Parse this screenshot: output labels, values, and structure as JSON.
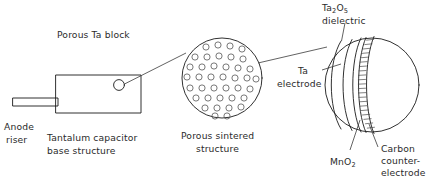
{
  "figure": {
    "title_visible": false,
    "background_color": "#ffffff",
    "line_color": "#1a1a1a",
    "text_color": "#2b2b2b"
  },
  "labels": {
    "porous_ta_block": "Porous Ta block",
    "anode_riser_line1": "Anode",
    "anode_riser_line2": "riser",
    "base_structure_line1": "Tantalum capacitor",
    "base_structure_line2": "base structure",
    "porous_sintered_line1": "Porous sintered",
    "porous_sintered_line2": "structure",
    "ta_electrode_line1": "Ta",
    "ta_electrode_line2": "electrode",
    "dielectric_formula_main1": "Ta",
    "dielectric_formula_sub1": "2",
    "dielectric_formula_main2": "O",
    "dielectric_formula_sub2": "5",
    "dielectric_word": "dielectric",
    "mno2_main1": "MnO",
    "mno2_sub": "2",
    "carbon_line1": "Carbon",
    "carbon_line2": "counter-",
    "carbon_line3": "electrode"
  },
  "views": {
    "base_block": {
      "name": "Tantalum capacitor base structure",
      "shape": "rectangle",
      "callout_circle": "magnification source"
    },
    "porous_circle": {
      "name": "Porous sintered structure",
      "shape": "circle",
      "pore_count_approx": 40
    },
    "detail_sphere": {
      "name": "Layered pore detail",
      "shape": "sphere",
      "layers": [
        "Ta electrode",
        "Ta2O5 dielectric",
        "MnO2",
        "Carbon counter-electrode"
      ]
    }
  }
}
